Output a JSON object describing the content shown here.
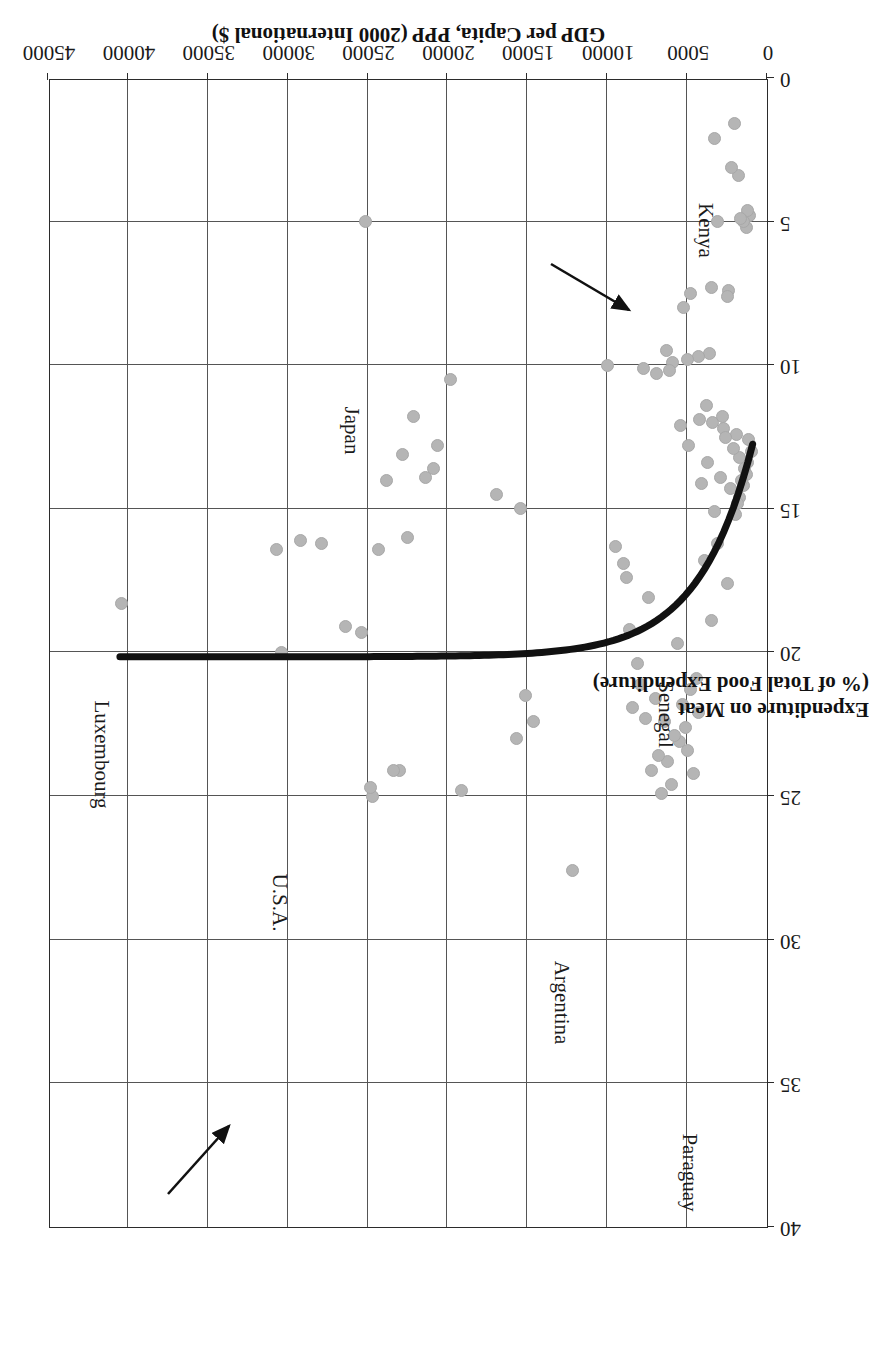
{
  "chart_data": {
    "type": "scatter",
    "title": "",
    "xlabel": "GDP per Capita, PPP (2000 International $)",
    "ylabel_line1": "Expenditure on Meat",
    "ylabel_line2": "(% of Total Food Expenditure)",
    "xlim": [
      0,
      45000
    ],
    "ylim": [
      0,
      40
    ],
    "xticks": [
      0,
      5000,
      10000,
      15000,
      20000,
      25000,
      30000,
      35000,
      40000,
      45000
    ],
    "xticklabels": [
      "0",
      "5000",
      "10000",
      "15000",
      "20000",
      "25000",
      "30000",
      "35000",
      "40000",
      "45000"
    ],
    "yticks": [
      0,
      5,
      10,
      15,
      20,
      25,
      30,
      35,
      40
    ],
    "yticklabels": [
      "0",
      "5",
      "10",
      "15",
      "20",
      "25",
      "30",
      "35",
      "40"
    ],
    "grid": true,
    "legend": "none",
    "orientation_note": "figure printed rotated 180 degrees",
    "series": [
      {
        "name": "Countries",
        "marker": "circle",
        "color": "#b5b5b5",
        "points": [
          [
            1100,
            4.8
          ],
          [
            1250,
            4.6
          ],
          [
            1300,
            5.2
          ],
          [
            1500,
            5.0
          ],
          [
            1650,
            4.9
          ],
          [
            1800,
            3.4
          ],
          [
            2050,
            1.6
          ],
          [
            2200,
            3.1
          ],
          [
            2400,
            7.4
          ],
          [
            2500,
            7.6
          ],
          [
            3100,
            5.0
          ],
          [
            3300,
            2.1
          ],
          [
            3500,
            7.3
          ],
          [
            3600,
            9.6
          ],
          [
            4300,
            9.7
          ],
          [
            4800,
            7.5
          ],
          [
            5000,
            9.8
          ],
          [
            5200,
            8.0
          ],
          [
            5900,
            9.9
          ],
          [
            6300,
            9.5
          ],
          [
            1000,
            13.0
          ],
          [
            1150,
            12.6
          ],
          [
            1200,
            13.4
          ],
          [
            1300,
            13.8
          ],
          [
            1400,
            13.6
          ],
          [
            1500,
            14.2
          ],
          [
            1600,
            14.0
          ],
          [
            1700,
            14.6
          ],
          [
            1750,
            13.2
          ],
          [
            1850,
            14.8
          ],
          [
            1900,
            12.4
          ],
          [
            2000,
            15.2
          ],
          [
            2100,
            12.9
          ],
          [
            2300,
            14.3
          ],
          [
            2500,
            17.6
          ],
          [
            2700,
            12.2
          ],
          [
            2900,
            13.9
          ],
          [
            3100,
            16.2
          ],
          [
            3300,
            15.1
          ],
          [
            3500,
            18.9
          ],
          [
            3700,
            13.4
          ],
          [
            3900,
            16.8
          ],
          [
            4100,
            14.1
          ],
          [
            4300,
            22.1
          ],
          [
            4400,
            20.9
          ],
          [
            4600,
            24.2
          ],
          [
            4800,
            21.3
          ],
          [
            5000,
            23.4
          ],
          [
            5100,
            22.6
          ],
          [
            5300,
            21.8
          ],
          [
            5500,
            23.1
          ],
          [
            5600,
            19.7
          ],
          [
            5800,
            22.9
          ],
          [
            6000,
            24.6
          ],
          [
            6200,
            23.8
          ],
          [
            6400,
            22.4
          ],
          [
            6600,
            24.9
          ],
          [
            6800,
            23.6
          ],
          [
            7000,
            21.6
          ],
          [
            7200,
            24.1
          ],
          [
            7400,
            18.1
          ],
          [
            7600,
            22.3
          ],
          [
            7900,
            21.1
          ],
          [
            8100,
            20.4
          ],
          [
            8400,
            21.9
          ],
          [
            8600,
            19.2
          ],
          [
            8800,
            17.4
          ],
          [
            9000,
            16.9
          ],
          [
            9500,
            16.3
          ],
          [
            10000,
            10.0
          ],
          [
            7700,
            10.1
          ],
          [
            6900,
            10.3
          ],
          [
            6100,
            10.2
          ],
          [
            5400,
            12.1
          ],
          [
            4900,
            12.8
          ],
          [
            4200,
            11.9
          ],
          [
            3800,
            11.4
          ],
          [
            3400,
            12.0
          ],
          [
            2800,
            11.8
          ],
          [
            2600,
            12.5
          ],
          [
            12200,
            27.6
          ],
          [
            14600,
            22.4
          ],
          [
            15100,
            21.5
          ],
          [
            15400,
            15.0
          ],
          [
            15700,
            23.0
          ],
          [
            16900,
            14.5
          ],
          [
            19100,
            24.8
          ],
          [
            19800,
            10.5
          ],
          [
            20600,
            12.8
          ],
          [
            20900,
            13.6
          ],
          [
            21400,
            13.9
          ],
          [
            22100,
            11.8
          ],
          [
            22500,
            16.0
          ],
          [
            22800,
            13.1
          ],
          [
            23000,
            24.1
          ],
          [
            23400,
            24.1
          ],
          [
            23800,
            14.0
          ],
          [
            24300,
            16.4
          ],
          [
            24700,
            25.0
          ],
          [
            24800,
            24.7
          ],
          [
            25100,
            5.0
          ],
          [
            25400,
            19.3
          ],
          [
            26400,
            19.1
          ],
          [
            27900,
            16.2
          ],
          [
            29200,
            16.1
          ],
          [
            30400,
            20.0
          ],
          [
            30700,
            16.4
          ],
          [
            40400,
            18.3
          ]
        ]
      }
    ],
    "trendline": {
      "name": "fitted curve",
      "color": "#111111",
      "description": "decaying power curve from high GDP ~20% down to ~13% at low GDP"
    },
    "annotations": [
      {
        "label": "Paraguay",
        "x": 4700,
        "y": 36.5,
        "has_arrow": false
      },
      {
        "label": "Argentina",
        "x": 12200,
        "y": 30.5,
        "has_arrow": false
      },
      {
        "label": "U.S.A.",
        "x": 30400,
        "y": 27.0,
        "has_arrow": false
      },
      {
        "label": "Luxembourg",
        "x": 40400,
        "y": 21.5,
        "has_arrow": false
      },
      {
        "label": "Japan",
        "x": 26500,
        "y": 10.5,
        "has_arrow": false
      },
      {
        "label": "Senegal",
        "x": 6200,
        "y": 20.4,
        "has_arrow": true
      },
      {
        "label": "Kenya",
        "x": 3800,
        "y": 3.7,
        "has_arrow": true
      }
    ]
  }
}
